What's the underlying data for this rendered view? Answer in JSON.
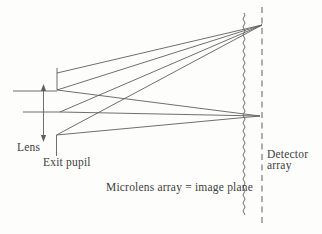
{
  "figure": {
    "background": "#fdfdfc",
    "line_color": "#5f5f5f",
    "text_color": "#3d3d3d"
  },
  "labels": {
    "lens": "Lens",
    "exit_pupil": "Exit pupil",
    "microlens": "Microlens array = image plane",
    "detector_line1": "Detector",
    "detector_line2": "array"
  },
  "diagram": {
    "canvas": {
      "width": 322,
      "height": 234
    },
    "lens_arrow": {
      "x": 43.5,
      "tip_top": 84,
      "tip_bottom": 142,
      "head_len": 7,
      "head_half_width": 2.6
    },
    "axis_rays": [
      [
        13,
        91,
        57,
        91
      ],
      [
        23,
        112,
        60,
        112
      ]
    ],
    "exit_pupil_segments": [
      [
        57,
        68,
        57,
        90
      ],
      [
        56.5,
        135,
        56.5,
        156
      ]
    ],
    "focus_top": [
      262,
      25
    ],
    "focus_mid": [
      260,
      116
    ],
    "ray_origins_top": [
      [
        57,
        73
      ],
      [
        57,
        90
      ],
      [
        60,
        112
      ],
      [
        56.5,
        135
      ]
    ],
    "ray_origins_mid": [
      [
        57,
        90
      ],
      [
        60,
        112
      ],
      [
        56.5,
        135
      ]
    ],
    "microlens_line": {
      "x": 244,
      "y1": 13,
      "y2": 214,
      "amplitude": 2.0,
      "half_period": 4
    },
    "detector_line": {
      "x": 262,
      "y1": 7,
      "y2": 224,
      "dash": "6,4.5"
    }
  }
}
